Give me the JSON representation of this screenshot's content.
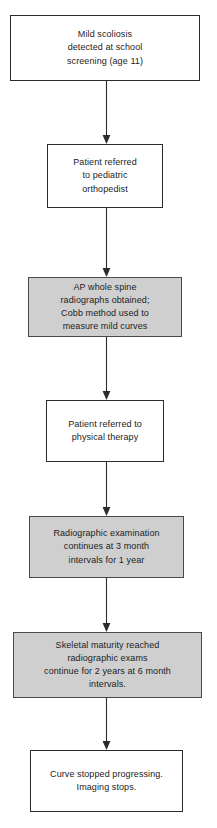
{
  "diagram": {
    "orientation": "top-to-bottom",
    "background_color": "#ffffff",
    "shaded_fill_color": "#cfcfcf",
    "plain_fill_color": "#ffffff",
    "border_color": "#2b2b2b",
    "text_color": "#1c1c1c",
    "nodes": [
      {
        "id": "node-1",
        "name": "mild-scoliosis-detected",
        "style": "plain",
        "text": "Mild scoliosis\ndetected at school\nscreening (age 11)",
        "x": 10,
        "y": 15,
        "width": 190,
        "height": 66
      },
      {
        "id": "node-2",
        "name": "patient-referred-orthopedist",
        "style": "plain",
        "text": "Patient referred\nto pediatric\northopedist",
        "x": 47,
        "y": 144,
        "width": 116,
        "height": 64
      },
      {
        "id": "node-3",
        "name": "ap-whole-spine-radiographs",
        "style": "shaded",
        "text": "AP whole spine\nradiographs obtained;\nCobb method used to\nmeasure mild curves",
        "x": 28,
        "y": 277,
        "width": 154,
        "height": 60
      },
      {
        "id": "node-4",
        "name": "patient-referred-physical-therapy",
        "style": "plain",
        "text": "Patient referred to\nphysical therapy",
        "x": 46,
        "y": 400,
        "width": 118,
        "height": 62
      },
      {
        "id": "node-5",
        "name": "radiographic-exam-3-month-intervals",
        "style": "shaded",
        "text": "Radiographic examination\ncontinues at 3 month\nintervals for 1 year",
        "x": 29,
        "y": 516,
        "width": 155,
        "height": 62
      },
      {
        "id": "node-6",
        "name": "skeletal-maturity-reached",
        "style": "shaded",
        "text": "Skeletal maturity reached\nradiographic exams\ncontinue for 2 years at 6 month\nintervals.",
        "x": 13,
        "y": 632,
        "width": 189,
        "height": 66
      },
      {
        "id": "node-7",
        "name": "curve-stopped-progressing",
        "style": "plain",
        "text": "Curve stopped progressing.\nImaging stops.",
        "x": 30,
        "y": 750,
        "width": 153,
        "height": 62
      }
    ],
    "connectors": [
      {
        "id": "arrow-1",
        "name": "arrow-node1-to-node2",
        "from": "node-1",
        "to": "node-2",
        "x": 100,
        "y": 81,
        "height": 63
      },
      {
        "id": "arrow-2",
        "name": "arrow-node2-to-node3",
        "from": "node-2",
        "to": "node-3",
        "x": 100,
        "y": 208,
        "height": 69
      },
      {
        "id": "arrow-3",
        "name": "arrow-node3-to-node4",
        "from": "node-3",
        "to": "node-4",
        "x": 100,
        "y": 337,
        "height": 63
      },
      {
        "id": "arrow-4",
        "name": "arrow-node4-to-node5",
        "from": "node-4",
        "to": "node-5",
        "x": 100,
        "y": 462,
        "height": 54
      },
      {
        "id": "arrow-5",
        "name": "arrow-node5-to-node6",
        "from": "node-5",
        "to": "node-6",
        "x": 100,
        "y": 578,
        "height": 54
      },
      {
        "id": "arrow-6",
        "name": "arrow-node6-to-node7",
        "from": "node-6",
        "to": "node-7",
        "x": 100,
        "y": 698,
        "height": 52
      }
    ]
  }
}
